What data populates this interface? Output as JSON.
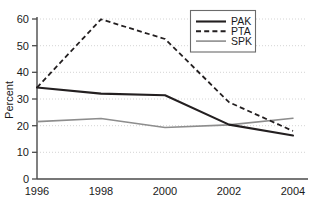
{
  "chart_data": {
    "type": "line",
    "title": "",
    "xlabel": "",
    "ylabel": "Percent",
    "x": [
      1996,
      1998,
      2000,
      2002,
      2004
    ],
    "xtick_labels": [
      "1996",
      "1998",
      "2000",
      "2002",
      "2004"
    ],
    "ytick_labels": [
      "0",
      "10",
      "20",
      "30",
      "40",
      "50",
      "60"
    ],
    "yticks": [
      0,
      10,
      20,
      30,
      40,
      50,
      60
    ],
    "ylim": [
      0,
      60
    ],
    "xlim": [
      1996,
      2004.4
    ],
    "grid": "horizontal-dotted",
    "legend_position": "top-right",
    "series": [
      {
        "name": "PAK",
        "values": [
          34.3,
          32.0,
          31.4,
          20.4,
          16.3
        ],
        "color": "#231f20",
        "style": "solid",
        "width": 2.1
      },
      {
        "name": "PTA",
        "values": [
          34.3,
          59.9,
          52.5,
          28.8,
          18.0
        ],
        "color": "#231f20",
        "style": "dashed",
        "width": 1.8
      },
      {
        "name": "SPK",
        "values": [
          21.5,
          22.7,
          19.3,
          20.3,
          22.8
        ],
        "color": "#8d8d8d",
        "style": "solid",
        "width": 1.6
      }
    ]
  },
  "legend": {
    "entries": [
      {
        "label": "PAK"
      },
      {
        "label": "PTA"
      },
      {
        "label": "SPK"
      }
    ]
  },
  "axis": {
    "y_title": "Percent"
  },
  "colors": {
    "series_dark": "#231f20",
    "series_gray": "#8d8d8d",
    "grid": "#cfcfcf",
    "axis": "#4a4a4a",
    "legend_border": "#6b6b6b"
  }
}
